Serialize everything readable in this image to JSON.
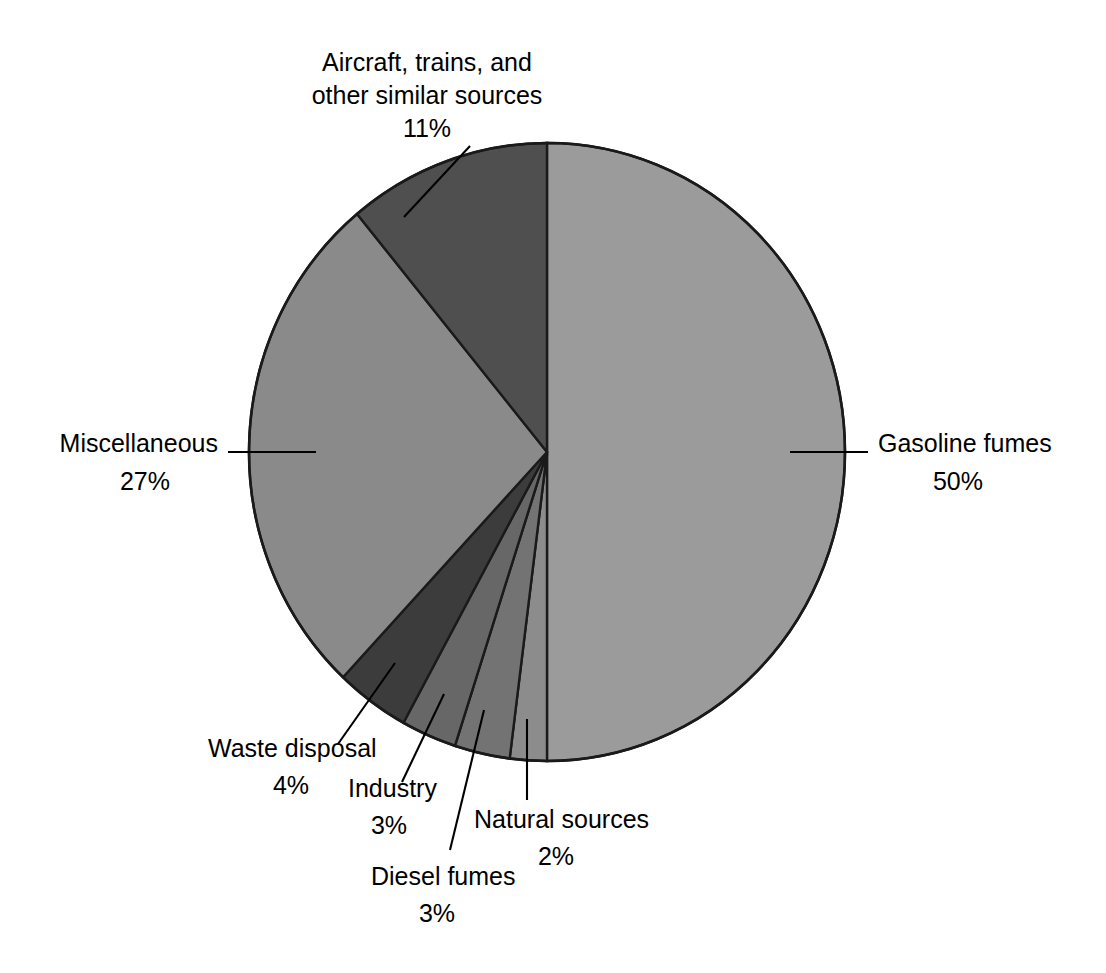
{
  "chart_data": {
    "type": "pie",
    "title": "",
    "subtitle": "",
    "xlabel": "",
    "ylabel": "",
    "legend_position": "none",
    "grid": false,
    "units": "%",
    "total": 100,
    "start_angle_deg": 0,
    "direction": "clockwise",
    "categories": [
      "Gasoline fumes",
      "Natural sources",
      "Diesel fumes",
      "Industry",
      "Waste disposal",
      "Miscellaneous",
      "Aircraft, trains, and other similar sources"
    ],
    "values": [
      50,
      2,
      3,
      3,
      4,
      27,
      11
    ],
    "slices": [
      {
        "label": "Gasoline fumes",
        "label_line1": "Gasoline fumes",
        "value": 50,
        "value_text": "50%",
        "color": "#9b9b9b",
        "start_deg": 0,
        "end_deg": 180
      },
      {
        "label": "Natural sources",
        "label_line1": "Natural sources",
        "value": 2,
        "value_text": "2%",
        "color": "#8c8c8c",
        "start_deg": 180,
        "end_deg": 187.2
      },
      {
        "label": "Diesel fumes",
        "label_line1": "Diesel fumes",
        "value": 3,
        "value_text": "3%",
        "color": "#737373",
        "start_deg": 187.2,
        "end_deg": 198
      },
      {
        "label": "Industry",
        "label_line1": "Industry",
        "value": 3,
        "value_text": "3%",
        "color": "#676767",
        "start_deg": 198,
        "end_deg": 208.8
      },
      {
        "label": "Waste disposal",
        "label_line1": "Waste disposal",
        "value": 4,
        "value_text": "4%",
        "color": "#3c3c3c",
        "start_deg": 208.8,
        "end_deg": 223.2
      },
      {
        "label": "Miscellaneous",
        "label_line1": "Miscellaneous",
        "value": 27,
        "value_text": "27%",
        "color": "#8a8a8a",
        "start_deg": 223.2,
        "end_deg": 320.4
      },
      {
        "label": "Aircraft, trains, and other similar sources",
        "label_line1": "Aircraft, trains, and",
        "label_line2": "other similar sources",
        "value": 11,
        "value_text": "11%",
        "color": "#4f4f4f",
        "start_deg": 320.4,
        "end_deg": 360
      }
    ]
  },
  "labels": {
    "aircraft": {
      "line1": "Aircraft, trains, and",
      "line2": "other similar sources",
      "pct": "11%"
    },
    "miscellaneous": {
      "line1": "Miscellaneous",
      "pct": "27%"
    },
    "gasoline": {
      "line1": "Gasoline fumes",
      "pct": "50%"
    },
    "waste": {
      "line1": "Waste disposal",
      "pct": "4%"
    },
    "industry": {
      "line1": "Industry",
      "pct": "3%"
    },
    "diesel": {
      "line1": "Diesel fumes",
      "pct": "3%"
    },
    "natural": {
      "line1": "Natural sources",
      "pct": "2%"
    }
  },
  "colors": {
    "background": "#ffffff",
    "outline": "#1a1a1a",
    "text": "#000000",
    "gasoline": "#9b9b9b",
    "miscellaneous": "#8a8a8a",
    "aircraft": "#4f4f4f",
    "waste_disposal": "#3c3c3c",
    "industry": "#676767",
    "diesel_fumes": "#737373",
    "natural_sources": "#8c8c8c"
  }
}
